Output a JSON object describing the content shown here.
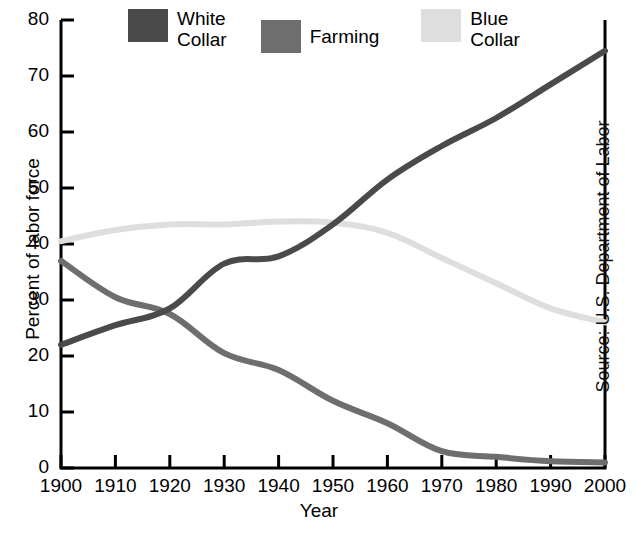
{
  "chart_data": {
    "type": "line",
    "title": "",
    "xlabel": "Year",
    "ylabel": "Percent of labor force",
    "source": "Source:  U.S. Department of Labor",
    "grid": false,
    "legend_position": "top",
    "xlim": [
      1900,
      2000
    ],
    "ylim": [
      0,
      80
    ],
    "x": [
      1900,
      1910,
      1920,
      1930,
      1940,
      1950,
      1960,
      1970,
      1980,
      1990,
      2000
    ],
    "xtick_labels": [
      "1900",
      "1910",
      "1920",
      "1930",
      "1940",
      "1950",
      "1960",
      "1970",
      "1980",
      "1990",
      "2000"
    ],
    "ytick_labels": [
      "0",
      "10",
      "20",
      "30",
      "40",
      "50",
      "60",
      "70",
      "80"
    ],
    "yticks": [
      0,
      10,
      20,
      30,
      40,
      50,
      60,
      70,
      80
    ],
    "series": [
      {
        "name": "White Collar",
        "label": "White\nCollar",
        "color": "#4a4a4a",
        "values": [
          22,
          25.5,
          28.5,
          36.5,
          37.8,
          43.5,
          51.5,
          57.5,
          62.5,
          68.5,
          74.5
        ]
      },
      {
        "name": "Farming",
        "label": "Farming",
        "color": "#6e6e6e",
        "values": [
          37,
          30.5,
          27.5,
          20.5,
          17.5,
          12,
          8,
          3,
          2,
          1.2,
          1
        ]
      },
      {
        "name": "Blue Collar",
        "label": "Blue\nCollar",
        "color": "#dedede",
        "values": [
          40.5,
          42.5,
          43.5,
          43.5,
          44,
          43.8,
          42,
          37.5,
          33,
          28.5,
          26
        ]
      }
    ]
  },
  "legend": {
    "entries": [
      {
        "label": "White\nCollar",
        "color": "#4a4a4a",
        "icon": "legend-swatch-icon"
      },
      {
        "label": "Farming",
        "color": "#6e6e6e",
        "icon": "legend-swatch-icon"
      },
      {
        "label": "Blue\nCollar",
        "color": "#dedede",
        "icon": "legend-swatch-icon"
      }
    ]
  },
  "axes": {
    "x_title": "Year",
    "y_title": "Percent of labor force"
  },
  "annotations": {
    "source": "Source:  U.S. Department of Labor"
  }
}
